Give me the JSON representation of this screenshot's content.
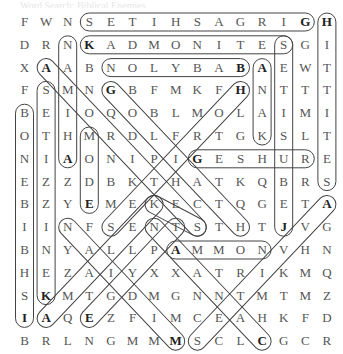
{
  "title": "Word Search: Biblical Enemies",
  "grid": {
    "origin_x": 24.5,
    "origin_y": 22,
    "col_step": 21.6,
    "row_step": 22.8,
    "rows": [
      "FWNSETIHSAGRIGH",
      "DRNKADMONITESGI",
      "XAABNOLYBABAEWT",
      "FSMNGBFMKFHNTTT",
      "BEIOQOBLMOLAIMI",
      "OTHMRDLFRTGKSLT",
      "NIAONIPIGESHURE",
      "EZZDBKTHATKQBRS",
      "BZYEMEKECTQGETA",
      "IINFSENTSTHTJVG",
      "BNYALLPAMMONVHN",
      "HEZAIYXXATRIKMQ",
      "SKMTGDMGNNTMTMZ",
      "IAQEZFIMCEAHKFD",
      "BRLNGMMMSCLCGCR"
    ],
    "bold_cells": [
      [
        0,
        13
      ],
      [
        0,
        14
      ],
      [
        1,
        3
      ],
      [
        2,
        1
      ],
      [
        2,
        10
      ],
      [
        2,
        11
      ],
      [
        3,
        4
      ],
      [
        3,
        10
      ],
      [
        6,
        2
      ],
      [
        6,
        8
      ],
      [
        8,
        3
      ],
      [
        8,
        14
      ],
      [
        9,
        12
      ],
      [
        10,
        7
      ],
      [
        12,
        1
      ],
      [
        13,
        0
      ],
      [
        13,
        1
      ],
      [
        13,
        3
      ],
      [
        14,
        7
      ],
      [
        14,
        11
      ]
    ]
  },
  "found_words": [
    {
      "word": "GIRGASHITES",
      "start": [
        0,
        13
      ],
      "end": [
        0,
        3
      ]
    },
    {
      "word": "HITTITES",
      "start": [
        0,
        14
      ],
      "end": [
        7,
        14
      ]
    },
    {
      "word": "KADMONITES",
      "start": [
        1,
        3
      ],
      "end": [
        1,
        12
      ]
    },
    {
      "word": "JEBUSITES",
      "start": [
        9,
        12
      ],
      "end": [
        1,
        12
      ]
    },
    {
      "word": "AHIMAN",
      "start": [
        6,
        2
      ],
      "end": [
        1,
        2
      ]
    },
    {
      "word": "BABYLON",
      "start": [
        2,
        10
      ],
      "end": [
        2,
        4
      ]
    },
    {
      "word": "ANAK",
      "start": [
        2,
        11
      ],
      "end": [
        5,
        11
      ]
    },
    {
      "word": "AMORITES",
      "start": [
        2,
        1
      ],
      "end": [
        9,
        8
      ]
    },
    {
      "word": "GOLIATH",
      "start": [
        3,
        4
      ],
      "end": [
        9,
        10
      ]
    },
    {
      "word": "HORITES",
      "start": [
        3,
        10
      ],
      "end": [
        9,
        4
      ]
    },
    {
      "word": "KENIZZITES",
      "start": [
        12,
        1
      ],
      "end": [
        3,
        1
      ]
    },
    {
      "word": "ISHBIBENOB",
      "start": [
        13,
        0
      ],
      "end": [
        4,
        0
      ]
    },
    {
      "word": "EDOM",
      "start": [
        8,
        3
      ],
      "end": [
        5,
        3
      ]
    },
    {
      "word": "GESHUR",
      "start": [
        6,
        8
      ],
      "end": [
        6,
        13
      ]
    },
    {
      "word": "AMMON",
      "start": [
        10,
        7
      ],
      "end": [
        10,
        11
      ]
    },
    {
      "word": "AMALEK",
      "start": [
        13,
        1
      ],
      "end": [
        8,
        6
      ]
    },
    {
      "word": "EGYPT",
      "start": [
        13,
        3
      ],
      "end": [
        9,
        7
      ]
    },
    {
      "word": "MIDIAN",
      "start": [
        14,
        7
      ],
      "end": [
        9,
        2
      ]
    },
    {
      "word": "CANAAN",
      "start": [
        14,
        11
      ],
      "end": [
        9,
        6
      ]
    },
    {
      "word": "AVVITES",
      "start": [
        8,
        14
      ],
      "end": [
        14,
        8
      ]
    },
    {
      "word": "KETEKS",
      "start": [
        8,
        6
      ],
      "end": [
        9,
        8
      ]
    }
  ],
  "colors": {
    "letter": "#555555",
    "found_letter": "#222222",
    "capsule_stroke": "#444444",
    "background": "#ffffff"
  }
}
